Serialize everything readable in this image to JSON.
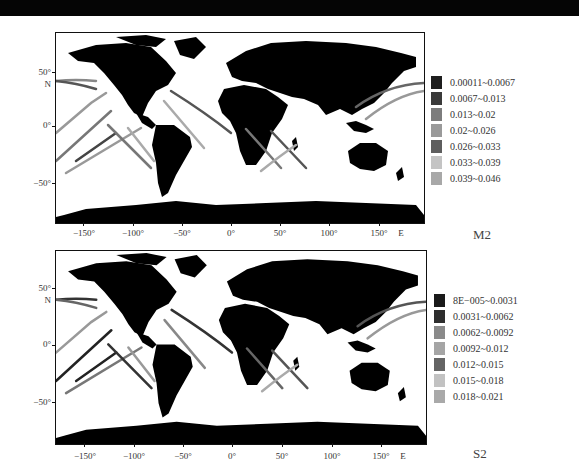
{
  "figure": {
    "panels": [
      {
        "id": "M2",
        "label": "M2",
        "y_ticks": [
          "50°",
          "N",
          "0°",
          "−50°"
        ],
        "x_ticks": [
          "−150°",
          "−100°",
          "−50°",
          "0°",
          "50°",
          "100°",
          "150°",
          "E"
        ],
        "legend": [
          {
            "label": "0.00011~0.0067",
            "color": "#1e1e1e"
          },
          {
            "label": "0.0067~0.013",
            "color": "#3a3a3a"
          },
          {
            "label": "0.013~0.02",
            "color": "#7d7d7d"
          },
          {
            "label": "0.02~0.026",
            "color": "#9a9a9a"
          },
          {
            "label": "0.026~0.033",
            "color": "#5e5e5e"
          },
          {
            "label": "0.033~0.039",
            "color": "#c4c4c4"
          },
          {
            "label": "0.039~0.046",
            "color": "#a8a8a8"
          }
        ]
      },
      {
        "id": "S2",
        "label": "S2",
        "y_ticks": [
          "50°",
          "N",
          "0°",
          "−50°"
        ],
        "x_ticks": [
          "−150°",
          "−100°",
          "−50°",
          "0°",
          "50°",
          "100°",
          "150°",
          "E"
        ],
        "legend": [
          {
            "label": "8E−005~0.0031",
            "color": "#1a1a1a"
          },
          {
            "label": "0.0031~0.0062",
            "color": "#2e2e2e"
          },
          {
            "label": "0.0062~0.0092",
            "color": "#8a8a8a"
          },
          {
            "label": "0.0092~0.012",
            "color": "#a5a5a5"
          },
          {
            "label": "0.012~0.015",
            "color": "#646464"
          },
          {
            "label": "0.015~0.018",
            "color": "#c2c2c2"
          },
          {
            "label": "0.018~0.021",
            "color": "#a9a9a9"
          }
        ]
      }
    ]
  },
  "colors": {
    "land": "#000000",
    "ocean": "#ffffff",
    "frame": "#111111",
    "top_band": "#050505"
  }
}
